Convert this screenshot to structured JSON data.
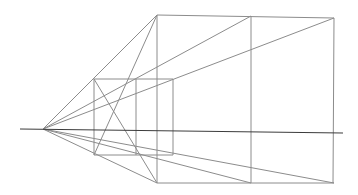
{
  "diagram": {
    "title": "",
    "type": "one-point perspective construction",
    "colors": {
      "background": "#ffffff",
      "construction_line": "#8c8c8c",
      "horizon_line": "#3c3c3c"
    },
    "elements": [
      {
        "name": "horizon-line",
        "description": "horizontal horizon line"
      },
      {
        "name": "vanishing-point",
        "description": "single vanishing point on horizon at left"
      },
      {
        "name": "large-rectangle",
        "description": "large front rectangle divided by a middle vertical"
      },
      {
        "name": "small-square",
        "description": "smaller receding square with inner vertical"
      },
      {
        "name": "orthogonal-lines",
        "description": "six rays from vanishing point to corners of large rectangle"
      },
      {
        "name": "diagonal-lines",
        "description": "two crossing diagonals through small square"
      }
    ]
  }
}
